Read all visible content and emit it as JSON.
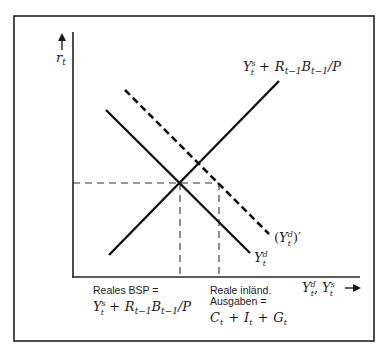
{
  "figure": {
    "type": "economic-diagram",
    "axes": {
      "y_label": "r_t",
      "x_label": "Y_t^d, Y_t^s"
    },
    "curves": [
      {
        "id": "supply",
        "label": "Y_t^s + R_{t-1}B_{t-1}/P",
        "style": "solid",
        "slope": "upward"
      },
      {
        "id": "demand",
        "label": "Y_t^d",
        "style": "solid",
        "slope": "downward"
      },
      {
        "id": "demand-shifted",
        "label": "(Y_t^d)'",
        "style": "dashed",
        "slope": "downward"
      }
    ],
    "annotations": {
      "left": {
        "line1": "Reales BSP =",
        "formula": "Y_t^s + R_{t-1}B_{t-1}/P"
      },
      "right": {
        "line1": "Reale inländ.",
        "line2": "Ausgaben =",
        "formula": "C_t + I_t + G_t"
      }
    }
  },
  "labels": {
    "y_axis": "r",
    "y_axis_sub": "t",
    "x_axis_Y1": "Y",
    "x_axis_Y1_sup": "d",
    "x_axis_Y1_sub": "t",
    "x_axis_sep": ",",
    "x_axis_Y2": "Y",
    "x_axis_Y2_sup": "s",
    "x_axis_Y2_sub": "t",
    "supply_Y": "Y",
    "supply_sup": "s",
    "supply_sub": "t",
    "supply_plus": "+",
    "supply_R": "R",
    "supply_R_sub": "t−1",
    "supply_B": "B",
    "supply_B_sub": "t−1",
    "supply_P": "/P",
    "demand_Y": "Y",
    "demand_sup": "d",
    "demand_sub": "t",
    "shift_open": "(",
    "shift_Y": "Y",
    "shift_sup": "d",
    "shift_sub": "t",
    "shift_close": ")′",
    "left_line1": "Reales BSP =",
    "right_line1": "Reale inländ.",
    "right_line2": "Ausgaben =",
    "C": "C",
    "C_sub": "t",
    "plus": "+",
    "I": "I",
    "I_sub": "t",
    "G": "G",
    "G_sub": "t"
  }
}
